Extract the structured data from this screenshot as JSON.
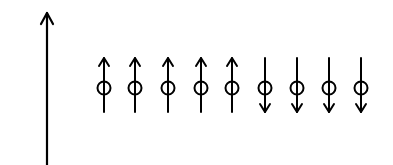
{
  "diagram": {
    "axis": {
      "x": 47,
      "y_top": 12,
      "y_bottom": 165,
      "direction": "up"
    },
    "spins": [
      {
        "x": 104,
        "direction": "up"
      },
      {
        "x": 135,
        "direction": "up"
      },
      {
        "x": 168,
        "direction": "up"
      },
      {
        "x": 201,
        "direction": "up"
      },
      {
        "x": 232,
        "direction": "up"
      },
      {
        "x": 265,
        "direction": "down"
      },
      {
        "x": 297,
        "direction": "down"
      },
      {
        "x": 329,
        "direction": "down"
      },
      {
        "x": 361,
        "direction": "down"
      }
    ],
    "colors": {
      "stroke": "#000000",
      "background": "#ffffff"
    }
  }
}
